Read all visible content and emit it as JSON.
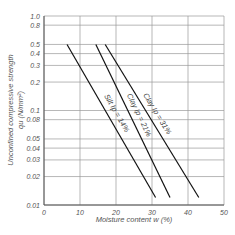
{
  "chart_data": {
    "type": "line",
    "title": "",
    "xlabel": "Moisture content  w  (%)",
    "ylabel": "Unconfined compressive strength",
    "ylabel2": "qu  (N/mm²)",
    "xlim": [
      0,
      50
    ],
    "ylim": [
      0.01,
      1.0
    ],
    "yscale": "log",
    "grid": true,
    "x_ticks": [
      "0",
      "10",
      "20",
      "30",
      "40",
      "50"
    ],
    "y_ticks": [
      "1.0",
      "0.8",
      "0.5",
      "0.4",
      "0.3",
      "0.2",
      "0.1",
      "0.08",
      "0.05",
      "0.04",
      "0.03",
      "0.02",
      "0.01"
    ],
    "series": [
      {
        "name": "Silt  Ip = 14%",
        "points": [
          [
            6.4,
            0.5
          ],
          [
            31,
            0.012
          ]
        ]
      },
      {
        "name": "Clay  Ip = 21%",
        "points": [
          [
            14.4,
            0.5
          ],
          [
            35,
            0.012
          ]
        ]
      },
      {
        "name": "Clay  Ip = 31%",
        "points": [
          [
            17,
            0.5
          ],
          [
            43,
            0.012
          ]
        ]
      }
    ]
  }
}
